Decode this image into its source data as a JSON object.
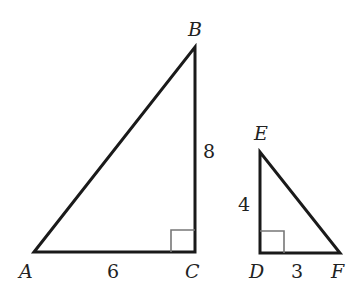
{
  "diagram": {
    "type": "similar right triangles",
    "triangles": [
      {
        "name": "ABC",
        "vertices": {
          "A": "A",
          "B": "B",
          "C": "C"
        },
        "right_angle_at": "C",
        "sides": {
          "AC": "6",
          "BC": "8"
        }
      },
      {
        "name": "DEF",
        "vertices": {
          "D": "D",
          "E": "E",
          "F": "F"
        },
        "right_angle_at": "D",
        "sides": {
          "ED": "4",
          "DF": "3"
        }
      }
    ]
  },
  "labels": {
    "A": "A",
    "B": "B",
    "C": "C",
    "D": "D",
    "E": "E",
    "F": "F",
    "AC": "6",
    "BC": "8",
    "ED": "4",
    "DF": "3"
  },
  "colors": {
    "stroke": "#1a1a1a",
    "right_angle_box": "#777777"
  }
}
